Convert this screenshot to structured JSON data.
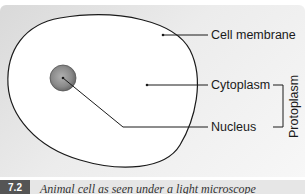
{
  "figure": {
    "number": "7.2",
    "caption": "Animal cell as seen under a light microscope"
  },
  "labels": {
    "cell_membrane": "Cell membrane",
    "cytoplasm": "Cytoplasm",
    "nucleus": "Nucleus",
    "protoplasm": "Protoplasm"
  },
  "colors": {
    "background": "#e8e8e8",
    "cell_fill": "#ffffff",
    "outline": "#1a1a1a",
    "nucleus_fill": "#8c8c8c",
    "badge": "#555555"
  }
}
